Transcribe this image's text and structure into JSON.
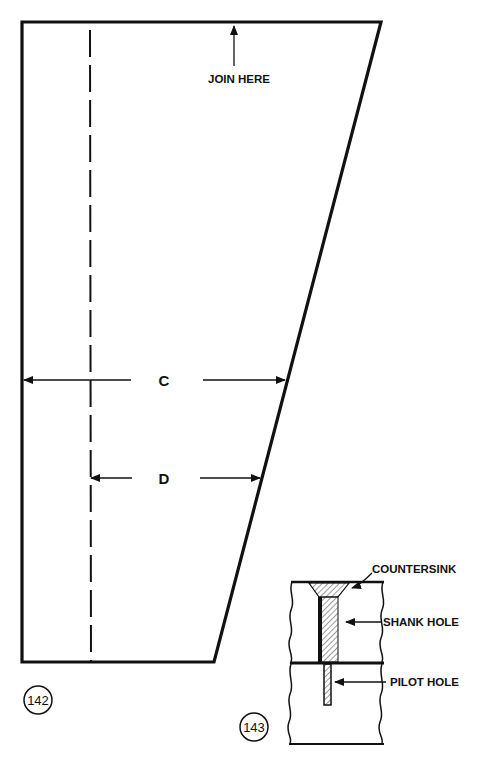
{
  "figures": [
    {
      "number": "142",
      "title": "Tapered panel template",
      "annotations": {
        "join_here": "JOIN HERE",
        "dimension_c": "C",
        "dimension_d": "D"
      }
    },
    {
      "number": "143",
      "title": "Screw hole cross-section",
      "annotations": {
        "countersink": "COUNTERSINK",
        "shank_hole": "SHANK HOLE",
        "pilot_hole": "PILOT HOLE"
      }
    }
  ],
  "colors": {
    "ink": "#111111",
    "background": "#ffffff",
    "hatch": "#555555"
  }
}
